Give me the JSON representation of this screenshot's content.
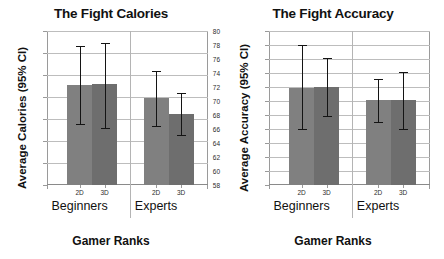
{
  "figure": {
    "panels": [
      {
        "id": "calories",
        "title": "The Fight Calories",
        "ylabel": "Average Calories (95% CI)",
        "xlabel": "Gamer Ranks"
      },
      {
        "id": "accuracy",
        "title": "The Fight Accuracy",
        "ylabel": "Average Accuracy (95% CI)",
        "xlabel": "Gamer Ranks"
      }
    ]
  },
  "colors": {
    "bar_2d": "#808080",
    "bar_3d": "#6e6e6e",
    "error_bar": "#141414",
    "gridline": "#bdbdbd",
    "axis": "#9a9a9a",
    "text": "#111111",
    "background": "#ffffff"
  },
  "chart_data": [
    {
      "type": "bar",
      "id": "calories",
      "title": "The Fight Calories",
      "xlabel": "Gamer Ranks",
      "ylabel": "Average Calories (95% CI)",
      "ylim": [
        0,
        35
      ],
      "ytick_step": 5,
      "yticks": [
        0,
        5,
        10,
        15,
        20,
        25,
        30,
        35
      ],
      "grid": true,
      "legend": "none",
      "groups": [
        "Beginners",
        "Experts"
      ],
      "categories": [
        "2D",
        "3D"
      ],
      "bars": [
        {
          "group": "Beginners",
          "category": "2D",
          "value": 22.8,
          "ci_low": 13.9,
          "ci_high": 31.7
        },
        {
          "group": "Beginners",
          "category": "3D",
          "value": 23.0,
          "ci_low": 12.9,
          "ci_high": 32.3
        },
        {
          "group": "Experts",
          "category": "2D",
          "value": 19.8,
          "ci_low": 13.4,
          "ci_high": 25.8
        },
        {
          "group": "Experts",
          "category": "3D",
          "value": 16.2,
          "ci_low": 11.4,
          "ci_high": 20.8
        }
      ]
    },
    {
      "type": "bar",
      "id": "accuracy",
      "title": "The Fight Accuracy",
      "xlabel": "Gamer Ranks",
      "ylabel": "Average Accuracy (95% CI)",
      "ylim": [
        58,
        80
      ],
      "ytick_step": 2,
      "yticks": [
        58,
        60,
        62,
        64,
        66,
        68,
        70,
        72,
        74,
        76,
        78,
        80
      ],
      "grid": true,
      "legend": "none",
      "groups": [
        "Beginners",
        "Experts"
      ],
      "categories": [
        "2D",
        "3D"
      ],
      "bars": [
        {
          "group": "Beginners",
          "category": "2D",
          "value": 71.9,
          "ci_low": 66.0,
          "ci_high": 78.0
        },
        {
          "group": "Beginners",
          "category": "3D",
          "value": 72.0,
          "ci_low": 67.9,
          "ci_high": 76.1
        },
        {
          "group": "Experts",
          "category": "2D",
          "value": 70.2,
          "ci_low": 67.0,
          "ci_high": 73.1
        },
        {
          "group": "Experts",
          "category": "3D",
          "value": 70.1,
          "ci_low": 66.0,
          "ci_high": 74.2
        }
      ]
    }
  ]
}
